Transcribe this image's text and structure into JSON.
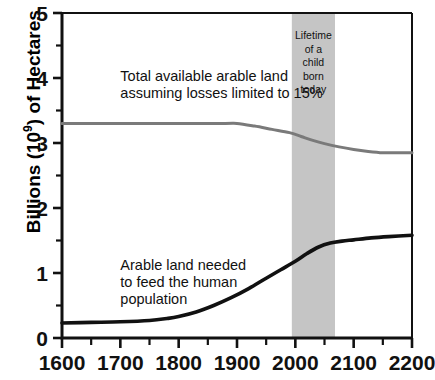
{
  "chart_data": {
    "type": "line",
    "title": "",
    "xlabel": "",
    "ylabel": "Billions (10^9) of Hectares",
    "ylabel_prefix": "Billions (10",
    "ylabel_exponent": "9",
    "ylabel_suffix": ") of Hectares",
    "xlim": [
      1600,
      2200
    ],
    "ylim": [
      0,
      5
    ],
    "xticks": [
      1600,
      1700,
      1800,
      1900,
      2000,
      2100,
      2200
    ],
    "xticklabels": [
      "1600",
      "1700",
      "1800",
      "1900",
      "2000",
      "2100",
      "2200"
    ],
    "xminorticks": [
      1650,
      1750,
      1850,
      1950,
      2050,
      2150
    ],
    "yticks": [
      0,
      1,
      2,
      3,
      4,
      5
    ],
    "yticklabels": [
      "0",
      "1",
      "2",
      "3",
      "4",
      "5"
    ],
    "yminorticks": [
      0.5,
      1.5,
      2.5,
      3.5,
      4.5
    ],
    "grid": false,
    "legend": "none",
    "series": [
      {
        "name": "Total available arable land assuming losses limited to 15%",
        "color": "#7a7a7a",
        "linewidth": 3.0,
        "x": [
          1600,
          1700,
          1800,
          1880,
          1900,
          1930,
          1960,
          1990,
          2010,
          2030,
          2050,
          2075,
          2100,
          2125,
          2150,
          2175,
          2200
        ],
        "y": [
          3.3,
          3.3,
          3.3,
          3.3,
          3.3,
          3.26,
          3.21,
          3.16,
          3.1,
          3.04,
          2.99,
          2.94,
          2.9,
          2.87,
          2.85,
          2.85,
          2.85
        ]
      },
      {
        "name": "Arable land needed to feed the human population",
        "color": "#111111",
        "linewidth": 3.6,
        "x": [
          1600,
          1650,
          1700,
          1750,
          1780,
          1800,
          1830,
          1860,
          1890,
          1920,
          1950,
          1975,
          2000,
          2020,
          2040,
          2060,
          2080,
          2100,
          2130,
          2160,
          2200
        ],
        "y": [
          0.23,
          0.24,
          0.25,
          0.27,
          0.3,
          0.33,
          0.4,
          0.5,
          0.62,
          0.76,
          0.92,
          1.05,
          1.18,
          1.3,
          1.4,
          1.46,
          1.49,
          1.51,
          1.54,
          1.56,
          1.58
        ]
      }
    ],
    "annotations": [
      {
        "name": "upper-series-label",
        "lines": [
          "Total available arable land",
          "assuming losses limited to 15%"
        ],
        "x": 1700,
        "y": 3.95
      },
      {
        "name": "lower-series-label",
        "lines": [
          "Arable land needed",
          "to feed the human",
          "population"
        ],
        "x": 1700,
        "y": 1.05
      }
    ],
    "shaded_bands": [
      {
        "name": "lifetime-of-a-child-band",
        "x0": 1994,
        "x1": 2068,
        "color": "#c5c5c5",
        "label_lines": [
          "Lifetime",
          "of a",
          "child",
          "born",
          "today"
        ]
      }
    ]
  }
}
